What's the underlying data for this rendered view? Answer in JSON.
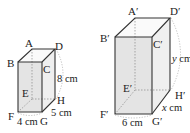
{
  "figure": {
    "left_prism": {
      "vertices": {
        "A": "A",
        "B": "B",
        "C": "C",
        "D": "D",
        "E": "E",
        "F": "F",
        "G": "G",
        "H": "H"
      },
      "dimensions": {
        "width": "4 cm",
        "depth": "5 cm",
        "height": "8 cm"
      }
    },
    "right_prism": {
      "vertices": {
        "A": "A′",
        "B": "B′",
        "C": "C′",
        "D": "D′",
        "E": "E′",
        "F": "F′",
        "G": "G′",
        "H": "H′"
      },
      "dimensions": {
        "width": "6 cm",
        "depth_var": "x",
        "depth_unit": " cm",
        "height_var": "y",
        "height_unit": " cm"
      }
    }
  },
  "colors": {
    "edge": "#333333",
    "face_front": "#e6e6e6",
    "face_side": "#f2f2f2",
    "face_top": "#fafafa",
    "hidden": "#888888"
  }
}
